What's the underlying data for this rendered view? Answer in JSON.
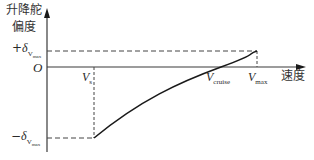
{
  "diagram": {
    "y_axis_label_line1": "升降舵",
    "y_axis_label_line2": "偏度",
    "x_axis_label": "速度",
    "origin_label": "O",
    "plus_delta": {
      "sign": "+",
      "symbol": "δ",
      "sub": "V",
      "subsub": "max"
    },
    "minus_delta": {
      "sign": "−",
      "symbol": "δ",
      "sub": "V",
      "subsub": "max"
    },
    "v_s": {
      "symbol": "V",
      "sub": "s"
    },
    "v_cruise": {
      "symbol": "V",
      "sub": "cruise"
    },
    "v_max": {
      "symbol": "V",
      "sub": "max"
    },
    "colors": {
      "axis": "#3a3a3a",
      "curve": "#1a1a1a",
      "dash": "#444444"
    }
  }
}
